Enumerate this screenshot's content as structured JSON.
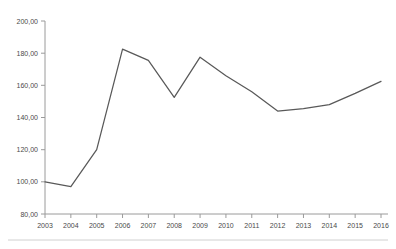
{
  "chart_data": {
    "type": "line",
    "title": "",
    "subtitle": "",
    "xlabel": "",
    "ylabel": "",
    "categories": [
      "2003",
      "2004",
      "2005",
      "2006",
      "2007",
      "2008",
      "2009",
      "2010",
      "2011",
      "2012",
      "2013",
      "2014",
      "2015",
      "2016"
    ],
    "x": [
      2003,
      2004,
      2005,
      2006,
      2007,
      2008,
      2009,
      2010,
      2011,
      2012,
      2013,
      2014,
      2015,
      2016
    ],
    "values": [
      100.0,
      97.0,
      120.0,
      182.5,
      175.5,
      152.5,
      177.5,
      166.0,
      156.0,
      144.0,
      145.5,
      148.0,
      155.0,
      162.5
    ],
    "series": [
      {
        "name": "",
        "values": [
          100.0,
          97.0,
          120.0,
          182.5,
          175.5,
          152.5,
          177.5,
          166.0,
          156.0,
          144.0,
          145.5,
          148.0,
          155.0,
          162.5
        ],
        "color": "#595959"
      }
    ],
    "ylim": [
      80,
      200
    ],
    "xlim": [
      2003,
      2016
    ],
    "y_ticks": [
      80,
      100,
      120,
      140,
      160,
      180,
      200
    ],
    "y_tick_labels": [
      "80,00",
      "100,00",
      "120,00",
      "140,00",
      "160,00",
      "180,00",
      "200,00"
    ],
    "x_tick_labels": [
      "2003",
      "2004",
      "2005",
      "2006",
      "2007",
      "2008",
      "2009",
      "2010",
      "2011",
      "2012",
      "2013",
      "2014",
      "2015",
      "2016"
    ],
    "grid": false,
    "legend": false,
    "legend_position": "none",
    "annotations": []
  },
  "style": {
    "line_color": "#595959",
    "axis_color": "#9a9a9a",
    "tick_text_color": "#4a4a4a",
    "background": "#ffffff",
    "footer_rule_color": "#d0d0d0"
  }
}
